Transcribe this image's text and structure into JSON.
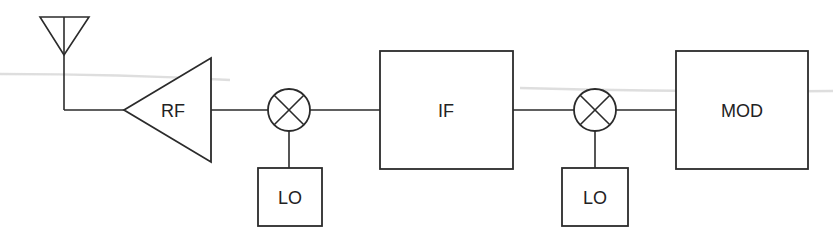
{
  "diagram": {
    "type": "block-diagram",
    "colors": {
      "stroke": "#2b2b2b",
      "background": "#ffffff",
      "text": "#222222"
    },
    "nodes": [
      {
        "id": "antenna",
        "kind": "antenna-symbol",
        "label": ""
      },
      {
        "id": "rf",
        "kind": "amplifier-triangle",
        "label": "RF"
      },
      {
        "id": "mixer1",
        "kind": "mixer-circle-x",
        "label": ""
      },
      {
        "id": "lo1",
        "kind": "box",
        "label": "LO"
      },
      {
        "id": "if",
        "kind": "box",
        "label": "IF"
      },
      {
        "id": "mixer2",
        "kind": "mixer-circle-x",
        "label": ""
      },
      {
        "id": "lo2",
        "kind": "box",
        "label": "LO"
      },
      {
        "id": "mod",
        "kind": "box",
        "label": "MOD"
      }
    ],
    "edges": [
      {
        "from": "antenna",
        "to": "rf"
      },
      {
        "from": "rf",
        "to": "mixer1"
      },
      {
        "from": "lo1",
        "to": "mixer1"
      },
      {
        "from": "mixer1",
        "to": "if"
      },
      {
        "from": "if",
        "to": "mixer2"
      },
      {
        "from": "lo2",
        "to": "mixer2"
      },
      {
        "from": "mixer2",
        "to": "mod"
      }
    ]
  },
  "labels": {
    "rf": "RF",
    "lo1": "LO",
    "if": "IF",
    "lo2": "LO",
    "mod": "MOD"
  }
}
